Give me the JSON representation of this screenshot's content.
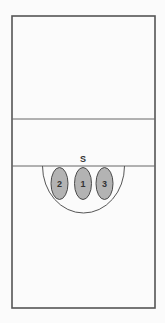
{
  "diagram": {
    "type": "volleyball-court-formation",
    "colors": {
      "line": "#555555",
      "player_fill": "#b3b3b3",
      "player_stroke": "#4a4a4a",
      "text": "#333333",
      "background": "#fbfbfb"
    },
    "court": {
      "x": 12,
      "y": 16,
      "width": 143,
      "height": 292
    },
    "lines": [
      {
        "name": "attack-line",
        "y": 119
      },
      {
        "name": "center-line",
        "y": 166
      }
    ],
    "arc": {
      "cx": 83.5,
      "cy": 166,
      "r": 41
    },
    "setter_label": "S",
    "players": [
      {
        "label": "2",
        "cx": 59.5,
        "cy": 183.5
      },
      {
        "label": "1",
        "cx": 83,
        "cy": 183.5
      },
      {
        "label": "3",
        "cx": 104.5,
        "cy": 183.5
      }
    ]
  }
}
